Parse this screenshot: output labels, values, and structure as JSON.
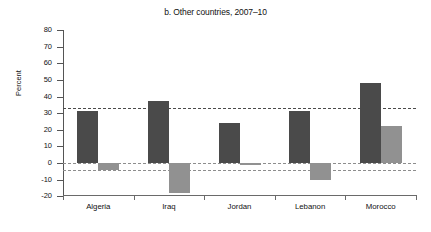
{
  "chart_data": {
    "type": "bar",
    "title": "b. Other countries, 2007–10",
    "xlabel": "",
    "ylabel": "Percent",
    "categories": [
      "Algeria",
      "Iraq",
      "Jordan",
      "Lebanon",
      "Morocco"
    ],
    "series": [
      {
        "name": "series-dark",
        "color": "#4a4a4a",
        "values": [
          31,
          37,
          24,
          31,
          48
        ]
      },
      {
        "name": "series-light",
        "color": "#919191",
        "values": [
          -4,
          -18,
          -1,
          -10,
          22
        ]
      }
    ],
    "ylim": [
      -20,
      80
    ],
    "yticks": [
      80,
      70,
      60,
      50,
      40,
      30,
      20,
      10,
      0,
      -10,
      -20
    ],
    "ytick_labels": [
      "80",
      "70",
      "60",
      "50",
      "40",
      "30",
      "20",
      "10",
      "0",
      "-10",
      "-20"
    ],
    "reference_lines": [
      {
        "name": "upper-average-line",
        "value": 33,
        "color": "#4a4a4a",
        "style": "dashed"
      },
      {
        "name": "lower-average-line",
        "value": -4,
        "color": "#8d8d8d",
        "style": "dashed"
      }
    ],
    "zero_line": {
      "value": 0,
      "color": "#8d8d8d",
      "style": "dashed"
    },
    "grid": false,
    "legend": null
  },
  "colors": {
    "dark_bar": "#4a4a4a",
    "light_bar": "#919191",
    "axis": "#555555",
    "background": "#ffffff"
  }
}
